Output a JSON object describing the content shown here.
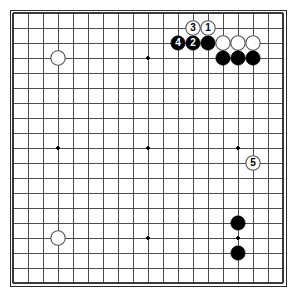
{
  "diagram": {
    "kind": "go-board-diagram",
    "board_size": 19,
    "background_color": "#ffffff",
    "line_color": "#3a3a3a",
    "border_color": "#2b2b2b",
    "black_color": "#000000",
    "white_fill": "#ffffff",
    "white_edge": "#555555",
    "star_point_color": "#000000",
    "geometry": {
      "origin_x": 13,
      "origin_y": 13,
      "spacing": 15,
      "stone_radius": 7.2,
      "star_radius": 1.8,
      "border_inset_x": 10,
      "border_inset_y": 10,
      "border_width": 276,
      "border_height": 276
    },
    "star_points": [
      {
        "col": 4,
        "row": 4
      },
      {
        "col": 10,
        "row": 4
      },
      {
        "col": 16,
        "row": 4
      },
      {
        "col": 4,
        "row": 10
      },
      {
        "col": 10,
        "row": 10
      },
      {
        "col": 16,
        "row": 10
      },
      {
        "col": 4,
        "row": 16
      },
      {
        "col": 10,
        "row": 16
      },
      {
        "col": 16,
        "row": 16
      }
    ],
    "stones": [
      {
        "id": "w-upper-left-star",
        "color": "white",
        "col": 4,
        "row": 4,
        "label": ""
      },
      {
        "id": "w-lower-left-star",
        "color": "white",
        "col": 4,
        "row": 16,
        "label": ""
      },
      {
        "id": "b-move-4",
        "color": "black",
        "col": 12,
        "row": 3,
        "label": "4"
      },
      {
        "id": "b-move-2",
        "color": "black",
        "col": 13,
        "row": 3,
        "label": "2"
      },
      {
        "id": "b-upper-a",
        "color": "black",
        "col": 14,
        "row": 3,
        "label": ""
      },
      {
        "id": "w-move-3",
        "color": "white",
        "col": 13,
        "row": 2,
        "label": "3"
      },
      {
        "id": "w-move-1",
        "color": "white",
        "col": 14,
        "row": 2,
        "label": "1"
      },
      {
        "id": "w-upper-a",
        "color": "white",
        "col": 15,
        "row": 3,
        "label": ""
      },
      {
        "id": "w-upper-b",
        "color": "white",
        "col": 16,
        "row": 3,
        "label": ""
      },
      {
        "id": "w-upper-c",
        "color": "white",
        "col": 17,
        "row": 3,
        "label": ""
      },
      {
        "id": "b-upper-b",
        "color": "black",
        "col": 15,
        "row": 4,
        "label": ""
      },
      {
        "id": "b-upper-c",
        "color": "black",
        "col": 16,
        "row": 4,
        "label": ""
      },
      {
        "id": "b-upper-d",
        "color": "black",
        "col": 17,
        "row": 4,
        "label": ""
      },
      {
        "id": "w-move-5",
        "color": "white",
        "col": 17,
        "row": 11,
        "label": "5"
      },
      {
        "id": "b-lower-right-a",
        "color": "black",
        "col": 16,
        "row": 15,
        "label": ""
      },
      {
        "id": "b-lower-right-b",
        "color": "black",
        "col": 16,
        "row": 17,
        "label": ""
      }
    ],
    "move_sequence": [
      {
        "number": "1",
        "color": "white"
      },
      {
        "number": "2",
        "color": "black"
      },
      {
        "number": "3",
        "color": "white"
      },
      {
        "number": "4",
        "color": "black"
      },
      {
        "number": "5",
        "color": "white"
      }
    ]
  }
}
